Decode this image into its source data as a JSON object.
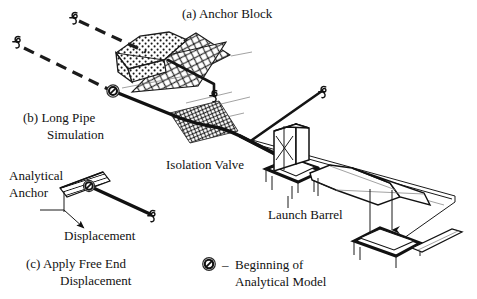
{
  "figure": {
    "title_implicit": "Pipeline anchor block and launch barrel analytical model",
    "background_color": "#ffffff",
    "line_color": "#111111"
  },
  "labels": {
    "anchor_block": "(a) Anchor Block",
    "long_pipe_simulation_line1": "(b) Long Pipe",
    "long_pipe_simulation_line2": "Simulation",
    "isolation_valve": "Isolation Valve",
    "launch_barrel": "Launch Barrel",
    "analytical_anchor_line1": "Analytical",
    "analytical_anchor_line2": "Anchor",
    "displacement": "Displacement",
    "apply_free_end_line1": "(c) Apply Free End",
    "apply_free_end_line2": "Displacement"
  },
  "legend": {
    "dash": "–",
    "text_line1": "Beginning of",
    "text_line2": "Analytical Model",
    "symbol_name": "circle-slash-icon"
  },
  "icons": {
    "spring_symbol": "spring-icon",
    "model_start_symbol": "circle-slash-icon",
    "displacement_arrow": "arrow-icon",
    "valve_symbol": "bowtie-valve-icon"
  },
  "components": {
    "anchor_block_fill": "stipple-concrete",
    "ground_plane_fill": "cross-hatch",
    "isolation_valve_pipe_fill": "dense-cross-hatch",
    "analytical_anchor_fill": "diagonal-hatch"
  }
}
